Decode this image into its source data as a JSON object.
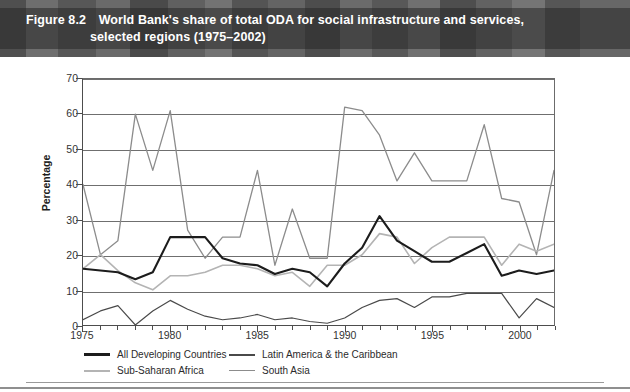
{
  "figure": {
    "number": "Figure 8.2",
    "title_line1": "World Bank's share of total ODA for social infrastructure and services,",
    "title_line2": "selected regions (1975–2002)"
  },
  "chart_data": {
    "type": "line",
    "title": "World Bank's share of total ODA for social infrastructure and services, selected regions (1975–2002)",
    "xlabel": "",
    "ylabel": "Percentage",
    "xlim": [
      1975,
      2002
    ],
    "ylim": [
      0,
      70
    ],
    "ytick_values": [
      0,
      10,
      20,
      30,
      40,
      50,
      60,
      70
    ],
    "xtick_values": [
      1975,
      1980,
      1985,
      1990,
      1995,
      2000
    ],
    "xtick_labels": [
      "1975",
      "1980",
      "1985",
      "1990",
      "1995",
      "2000"
    ],
    "ytick_labels": [
      "0",
      "10",
      "20",
      "30",
      "40",
      "50",
      "60",
      "70"
    ],
    "grid": "horizontal",
    "legend_position": "below-axes",
    "x": [
      1975,
      1976,
      1977,
      1978,
      1979,
      1980,
      1981,
      1982,
      1983,
      1984,
      1985,
      1986,
      1987,
      1988,
      1989,
      1990,
      1991,
      1992,
      1993,
      1994,
      1995,
      1996,
      1997,
      1998,
      1999,
      2000,
      2001,
      2002
    ],
    "series": [
      {
        "name": "All Developing Countries",
        "color": "#1c1c1c",
        "width": 2.1,
        "values": [
          16,
          15.5,
          15,
          13,
          15,
          25,
          25,
          25,
          19,
          17.5,
          17,
          14.5,
          16,
          15,
          11,
          17.5,
          22,
          31,
          24,
          21,
          18,
          18,
          20.5,
          23,
          14,
          15.5,
          14.5,
          15.5
        ]
      },
      {
        "name": "Latin America & the Caribbean",
        "color": "#4a4a4a",
        "width": 1.2,
        "values": [
          1.5,
          4,
          5.5,
          0,
          4,
          7,
          4.5,
          2.5,
          1.5,
          2,
          3,
          1.5,
          2,
          1,
          0.5,
          2,
          5,
          7,
          7.5,
          5,
          8,
          8,
          9,
          9,
          9,
          2,
          7.5,
          5
        ]
      },
      {
        "name": "Sub-Saharan Africa",
        "color": "#b4b4b4",
        "width": 1.6,
        "values": [
          16,
          20,
          15.5,
          12,
          10,
          14,
          14,
          15,
          17,
          17,
          16,
          14,
          15,
          11,
          17,
          17,
          20,
          26,
          25,
          17.5,
          22,
          25,
          25,
          25,
          17,
          23,
          21,
          23
        ]
      },
      {
        "name": "South Asia",
        "color": "#8c8c8c",
        "width": 1.3,
        "values": [
          40,
          20,
          24,
          60,
          44,
          61,
          27,
          19,
          25,
          25,
          44,
          17,
          33,
          19,
          19,
          62,
          61,
          54,
          41,
          49,
          41,
          41,
          41,
          57,
          36,
          35,
          20,
          44
        ]
      }
    ]
  },
  "legend": {
    "items": [
      {
        "label": "All Developing Countries",
        "color": "#1c1c1c",
        "width": 2.6
      },
      {
        "label": "Latin America & the Caribbean",
        "color": "#4a4a4a",
        "width": 2.0
      },
      {
        "label": "Sub-Saharan Africa",
        "color": "#b4b4b4",
        "width": 2.0
      },
      {
        "label": "South Asia",
        "color": "#8c8c8c",
        "width": 1.8
      }
    ]
  }
}
